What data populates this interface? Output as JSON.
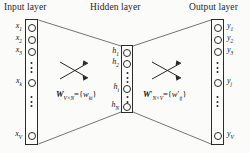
{
  "figure": {
    "type": "neural-network-diagram",
    "width": 250,
    "height": 153,
    "background": "#fbfbfa",
    "ink": "#1a1a1a"
  },
  "titles": {
    "input": "Input layer",
    "hidden": "Hidden layer",
    "output": "Output layer"
  },
  "layers": {
    "input": {
      "name": "Input layer",
      "size_symbol": "V",
      "nodes": [
        {
          "label": "x",
          "sub": "1",
          "kind": "unit"
        },
        {
          "label": "x",
          "sub": "2",
          "kind": "unit"
        },
        {
          "label": "x",
          "sub": "3",
          "kind": "unit"
        },
        {
          "label": "",
          "sub": "",
          "kind": "ellipsis"
        },
        {
          "label": "x",
          "sub": "k",
          "kind": "unit"
        },
        {
          "label": "",
          "sub": "",
          "kind": "ellipsis"
        },
        {
          "label": "x",
          "sub": "V",
          "kind": "unit"
        }
      ]
    },
    "hidden": {
      "name": "Hidden layer",
      "size_symbol": "N",
      "nodes": [
        {
          "label": "h",
          "sub": "1",
          "kind": "unit"
        },
        {
          "label": "h",
          "sub": "2",
          "kind": "unit"
        },
        {
          "label": "",
          "sub": "",
          "kind": "ellipsis"
        },
        {
          "label": "h",
          "sub": "i",
          "kind": "unit"
        },
        {
          "label": "",
          "sub": "",
          "kind": "ellipsis"
        },
        {
          "label": "h",
          "sub": "N",
          "kind": "unit"
        }
      ]
    },
    "output": {
      "name": "Output layer",
      "size_symbol": "V",
      "nodes": [
        {
          "label": "y",
          "sub": "1",
          "kind": "unit"
        },
        {
          "label": "y",
          "sub": "2",
          "kind": "unit"
        },
        {
          "label": "y",
          "sub": "3",
          "kind": "unit"
        },
        {
          "label": "",
          "sub": "",
          "kind": "ellipsis"
        },
        {
          "label": "y",
          "sub": "j",
          "kind": "unit"
        },
        {
          "label": "",
          "sub": "",
          "kind": "ellipsis"
        },
        {
          "label": "y",
          "sub": "V",
          "kind": "unit"
        }
      ]
    }
  },
  "weights": {
    "input_to_hidden": {
      "matrix": "W",
      "matrix_prime": false,
      "dims": "V×N",
      "element": "w",
      "element_prime": false,
      "element_sub": "ki",
      "text": "W V×N = {w ki}"
    },
    "hidden_to_output": {
      "matrix": "W",
      "matrix_prime": true,
      "dims": "N×V",
      "element": "w",
      "element_prime": true,
      "element_sub": "ij",
      "text": "W' N×V = {w' ij}"
    }
  },
  "node_labels": {
    "input": [
      "x1",
      "x2",
      "x3",
      "xk",
      "xV"
    ],
    "hidden": [
      "h1",
      "h2",
      "hi",
      "hN"
    ],
    "output": [
      "y1",
      "y2",
      "y3",
      "yj",
      "yV"
    ]
  },
  "connectors": {
    "left_fan": "input column edges taper to hidden column edges",
    "right_fan": "hidden column edges taper to output column edges",
    "arrow_crosses": 2
  }
}
